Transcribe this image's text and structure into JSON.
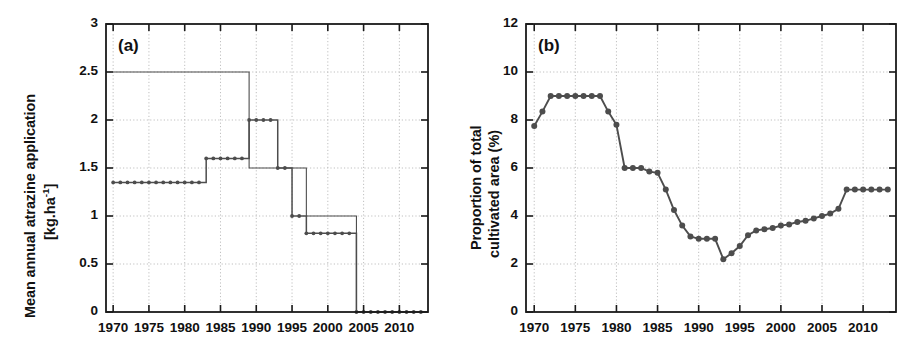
{
  "figure": {
    "background_color": "#ffffff",
    "line_color": "#4d4d4d",
    "marker_color": "#4d4d4d",
    "axis_color": "#1a1a1a",
    "grid_color": "#b9b9b9",
    "panels": [
      "a",
      "b"
    ]
  },
  "panel_a": {
    "tag": "(a)",
    "ylabel_line1": "Mean annual atrazine application",
    "ylabel_line2_prefix": "[kg.ha",
    "ylabel_line2_exponent": "-1",
    "ylabel_line2_suffix": "]",
    "ytick_labels": [
      "0",
      "0.5",
      "1",
      "1.5",
      "2",
      "2.5",
      "3"
    ],
    "xtick_labels": [
      "1970",
      "1975",
      "1980",
      "1985",
      "1990",
      "1995",
      "2000",
      "2005",
      "2010"
    ]
  },
  "panel_b": {
    "tag": "(b)",
    "ylabel_line1": "Proportion of total",
    "ylabel_line2": "cultivated area (%)",
    "ytick_labels": [
      "0",
      "2",
      "4",
      "6",
      "8",
      "10",
      "12"
    ],
    "xtick_labels": [
      "1970",
      "1975",
      "1980",
      "1985",
      "1990",
      "1995",
      "2000",
      "2005",
      "2010"
    ]
  },
  "chart_data": [
    {
      "type": "line",
      "panel": "a",
      "title": "(a)",
      "xlabel": "",
      "ylabel": "Mean annual atrazine application [kg.ha-1]",
      "xlim": [
        1969,
        2014
      ],
      "ylim": [
        0,
        3
      ],
      "ytick_values": [
        0,
        0.5,
        1,
        1.5,
        2,
        2.5,
        3
      ],
      "xtick_values": [
        1970,
        1975,
        1980,
        1985,
        1990,
        1995,
        2000,
        2005,
        2010
      ],
      "grid": true,
      "legend": "none",
      "drawstyle": "steps-post",
      "series": [
        {
          "name": "atrazine application (with markers)",
          "markers": true,
          "x": [
            1970,
            1971,
            1972,
            1973,
            1974,
            1975,
            1976,
            1977,
            1978,
            1979,
            1980,
            1981,
            1982,
            1983,
            1984,
            1985,
            1986,
            1987,
            1988,
            1989,
            1990,
            1991,
            1992,
            1993,
            1994,
            1995,
            1996,
            1997,
            1998,
            1999,
            2000,
            2001,
            2002,
            2003,
            2004,
            2005,
            2006,
            2007,
            2008,
            2009,
            2010,
            2011,
            2012,
            2013
          ],
          "values": [
            1.35,
            1.35,
            1.35,
            1.35,
            1.35,
            1.35,
            1.35,
            1.35,
            1.35,
            1.35,
            1.35,
            1.35,
            1.35,
            1.6,
            1.6,
            1.6,
            1.6,
            1.6,
            1.6,
            2.0,
            2.0,
            2.0,
            2.0,
            1.5,
            1.5,
            1.0,
            1.0,
            0.82,
            0.82,
            0.82,
            0.82,
            0.82,
            0.82,
            0.82,
            0.0,
            0.0,
            0.0,
            0.0,
            0.0,
            0.0,
            0.0,
            0.0,
            0.0,
            0.0
          ]
        },
        {
          "name": "atrazine application (thin step line)",
          "markers": false,
          "x": [
            1970,
            1988,
            1989,
            1993,
            1994,
            1996,
            1997,
            2003,
            2004,
            2013
          ],
          "values": [
            2.5,
            2.5,
            1.5,
            1.5,
            1.5,
            1.5,
            1.0,
            1.0,
            0.0,
            0.0
          ]
        }
      ]
    },
    {
      "type": "line",
      "panel": "b",
      "title": "(b)",
      "xlabel": "",
      "ylabel": "Proportion of total cultivated area (%)",
      "xlim": [
        1969,
        2014
      ],
      "ylim": [
        0,
        12
      ],
      "ytick_values": [
        0,
        2,
        4,
        6,
        8,
        10,
        12
      ],
      "xtick_values": [
        1970,
        1975,
        1980,
        1985,
        1990,
        1995,
        2000,
        2005,
        2010
      ],
      "grid": true,
      "legend": "none",
      "series": [
        {
          "name": "proportion of total cultivated area",
          "markers": true,
          "x": [
            1970,
            1971,
            1972,
            1973,
            1974,
            1975,
            1976,
            1977,
            1978,
            1979,
            1980,
            1981,
            1982,
            1983,
            1984,
            1985,
            1986,
            1987,
            1988,
            1989,
            1990,
            1991,
            1992,
            1993,
            1994,
            1995,
            1996,
            1997,
            1998,
            1999,
            2000,
            2001,
            2002,
            2003,
            2004,
            2005,
            2006,
            2007,
            2008,
            2009,
            2010,
            2011,
            2012,
            2013
          ],
          "values": [
            7.75,
            8.35,
            9.0,
            9.0,
            9.0,
            9.0,
            9.0,
            9.0,
            9.0,
            8.35,
            7.8,
            6.0,
            6.0,
            6.0,
            5.85,
            5.8,
            5.1,
            4.25,
            3.6,
            3.15,
            3.05,
            3.05,
            3.05,
            2.2,
            2.45,
            2.75,
            3.2,
            3.4,
            3.45,
            3.5,
            3.6,
            3.65,
            3.75,
            3.8,
            3.9,
            4.0,
            4.1,
            4.3,
            5.1,
            5.1,
            5.1,
            5.1,
            5.1,
            5.1
          ]
        }
      ]
    }
  ]
}
